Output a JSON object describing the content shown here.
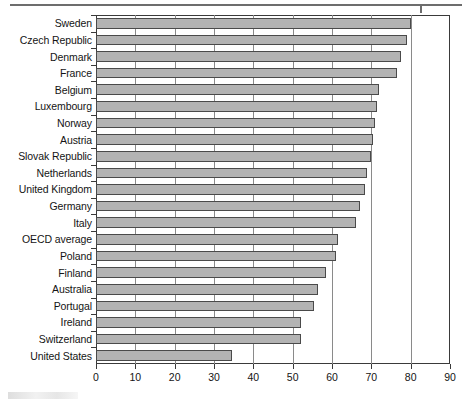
{
  "page": {
    "top_rule": "horizontal-rule",
    "footer_artifact": "scan-smudge"
  },
  "chart_data": {
    "type": "bar",
    "orientation": "horizontal",
    "title": "",
    "subtitle": "",
    "xlabel": "",
    "ylabel": "",
    "xlim": [
      0,
      90
    ],
    "xticks": [
      0,
      10,
      20,
      30,
      40,
      50,
      60,
      70,
      80,
      90
    ],
    "xtick_labels": [
      "0",
      "10",
      "20",
      "30",
      "40",
      "50",
      "60",
      "70",
      "80",
      "90"
    ],
    "grid": true,
    "grid_axis": "x",
    "legend": null,
    "bar_fill": "#b3b3b3",
    "bar_edge": "#4a4a4a",
    "categories": [
      "Sweden",
      "Czech Republic",
      "Denmark",
      "France",
      "Belgium",
      "Luxembourg",
      "Norway",
      "Austria",
      "Slovak Republic",
      "Netherlands",
      "United Kingdom",
      "Germany",
      "Italy",
      "OECD average",
      "Poland",
      "Finland",
      "Australia",
      "Portugal",
      "Ireland",
      "Switzerland",
      "United States"
    ],
    "values": [
      80.0,
      79.0,
      77.5,
      76.5,
      72.0,
      71.5,
      71.0,
      70.5,
      70.0,
      69.0,
      68.5,
      67.0,
      66.0,
      61.5,
      61.0,
      58.5,
      56.5,
      55.5,
      52.0,
      52.0,
      34.5
    ]
  }
}
